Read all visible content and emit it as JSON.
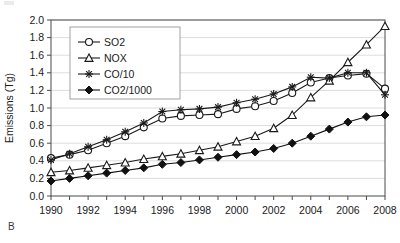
{
  "panel": {
    "label": "B"
  },
  "chart_data": {
    "type": "line",
    "title": "",
    "xlabel": "",
    "ylabel": "Emissions (Tg)",
    "xlim": [
      1990,
      2008
    ],
    "ylim": [
      0.0,
      2.0
    ],
    "grid": "horizontal",
    "legend_position": "top-left-inside",
    "x": [
      1990,
      1991,
      1992,
      1993,
      1994,
      1995,
      1996,
      1997,
      1998,
      1999,
      2000,
      2001,
      2002,
      2003,
      2004,
      2005,
      2006,
      2007,
      2008
    ],
    "xticks": [
      1990,
      1992,
      1994,
      1996,
      1998,
      2000,
      2002,
      2004,
      2006,
      2008
    ],
    "xtick_labels": [
      "1990",
      "1992",
      "1994",
      "1996",
      "1998",
      "2000",
      "2002",
      "2004",
      "2006",
      "2008"
    ],
    "xminor_ticks": [
      1990,
      1991,
      1992,
      1993,
      1994,
      1995,
      1996,
      1997,
      1998,
      1999,
      2000,
      2001,
      2002,
      2003,
      2004,
      2005,
      2006,
      2007,
      2008
    ],
    "yticks": [
      0.0,
      0.2,
      0.4,
      0.6,
      0.8,
      1.0,
      1.2,
      1.4,
      1.6,
      1.8,
      2.0
    ],
    "ytick_labels": [
      "0.0",
      "0.2",
      "0.4",
      "0.6",
      "0.8",
      "1.0",
      "1.2",
      "1.4",
      "1.6",
      "1.8",
      "2.0"
    ],
    "series": [
      {
        "name": "SO2",
        "marker": "open-circle",
        "color": "#1a1a1a",
        "values": [
          0.43,
          0.47,
          0.52,
          0.6,
          0.68,
          0.78,
          0.88,
          0.91,
          0.92,
          0.93,
          0.99,
          1.02,
          1.08,
          1.17,
          1.29,
          1.34,
          1.37,
          1.39,
          1.22
        ]
      },
      {
        "name": "NOX",
        "marker": "open-triangle",
        "color": "#1a1a1a",
        "values": [
          0.27,
          0.29,
          0.32,
          0.35,
          0.38,
          0.42,
          0.45,
          0.48,
          0.52,
          0.56,
          0.62,
          0.68,
          0.77,
          0.92,
          1.12,
          1.31,
          1.52,
          1.72,
          1.93
        ]
      },
      {
        "name": "CO/10",
        "marker": "asterisk",
        "color": "#1a1a1a",
        "values": [
          0.41,
          0.48,
          0.56,
          0.64,
          0.73,
          0.83,
          0.96,
          0.98,
          0.99,
          1.01,
          1.06,
          1.1,
          1.16,
          1.24,
          1.35,
          1.34,
          1.4,
          1.4,
          1.15
        ]
      },
      {
        "name": "CO2/1000",
        "marker": "filled-diamond",
        "color": "#111111",
        "values": [
          0.17,
          0.2,
          0.23,
          0.26,
          0.29,
          0.32,
          0.36,
          0.38,
          0.41,
          0.44,
          0.47,
          0.5,
          0.54,
          0.6,
          0.68,
          0.76,
          0.84,
          0.9,
          0.92
        ]
      }
    ]
  }
}
